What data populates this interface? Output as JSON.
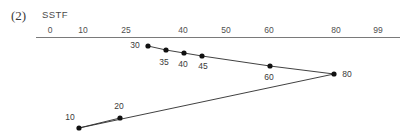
{
  "figure": {
    "number": "(2)",
    "algorithm": "SSTF"
  },
  "axis": {
    "label_color": "#4f4f4f",
    "line_color": "#7a7a7a",
    "ticks": [
      {
        "label": "0",
        "x": 50
      },
      {
        "label": "10",
        "x": 83
      },
      {
        "label": "25",
        "x": 126
      },
      {
        "label": "40",
        "x": 183
      },
      {
        "label": "50",
        "x": 226
      },
      {
        "label": "60",
        "x": 269
      },
      {
        "label": "80",
        "x": 336
      },
      {
        "label": "99",
        "x": 378
      }
    ]
  },
  "chart_data": {
    "type": "line",
    "title": "SSTF",
    "xlabel": "Cylinder number",
    "ylabel": "",
    "xlim": [
      0,
      99
    ],
    "grid": false,
    "legend": null,
    "marker_color": "#111111",
    "line_color": "#2b2b2b",
    "sequence": [
      30,
      35,
      40,
      45,
      60,
      80,
      10,
      20
    ],
    "points": [
      {
        "label": "30",
        "value": 30,
        "px": 148,
        "py": 46,
        "lx": 135,
        "ly": 48
      },
      {
        "label": "35",
        "value": 35,
        "px": 166,
        "py": 50,
        "lx": 164,
        "ly": 65
      },
      {
        "label": "40",
        "value": 40,
        "px": 184,
        "py": 53,
        "lx": 183,
        "ly": 67
      },
      {
        "label": "45",
        "value": 45,
        "px": 202,
        "py": 56,
        "lx": 203,
        "ly": 69
      },
      {
        "label": "60",
        "value": 60,
        "px": 270,
        "py": 66,
        "lx": 269,
        "ly": 80
      },
      {
        "label": "80",
        "value": 80,
        "px": 334,
        "py": 74,
        "lx": 347,
        "ly": 77
      },
      {
        "label": "10",
        "value": 10,
        "px": 79,
        "py": 128,
        "lx": 70,
        "ly": 120
      },
      {
        "label": "20",
        "value": 20,
        "px": 120,
        "py": 118,
        "lx": 119,
        "ly": 109
      }
    ]
  }
}
